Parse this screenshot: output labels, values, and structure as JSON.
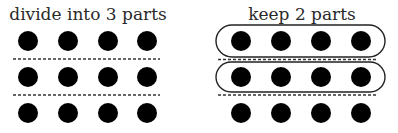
{
  "left_panel": {
    "title": "divide into 3 parts",
    "rows": 3,
    "cols": 4,
    "divider_count": 2
  },
  "right_panel": {
    "title": "keep 2 parts",
    "rows": 3,
    "cols": 4,
    "divider_count": 2,
    "kept_rows": 2
  },
  "colors": {
    "dot": "#000000",
    "text": "#2a2a2a",
    "divider": "#333333",
    "outline": "#222222"
  }
}
